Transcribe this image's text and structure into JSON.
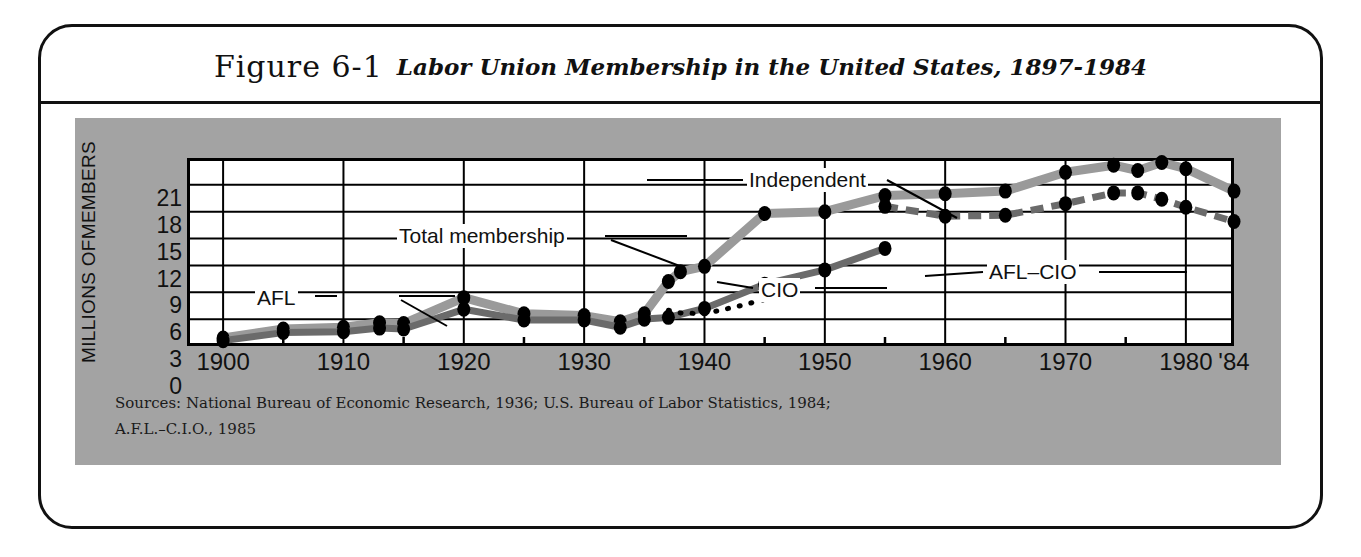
{
  "figure": {
    "number": "Figure 6-1",
    "title": "Labor Union Membership in the United States, 1897-1984"
  },
  "sources": {
    "line1": "Sources:  National Bureau of Economic Research, 1936; U.S. Bureau of Labor Statistics, 1984;",
    "line2": "A.F.L.–C.I.O., 1985"
  },
  "annotations": {
    "afl": "AFL",
    "total": "Total membership",
    "independent": "Independent",
    "cio": "CIO",
    "afl_cio": "AFL–CIO"
  },
  "colors": {
    "plate": "#a3a3a3",
    "total_line": "#9a9a9a",
    "component_line": "#6b6b6b",
    "marker": "#000000",
    "frame": "#111111",
    "plot_bg": "#ffffff"
  },
  "chart_data": {
    "type": "line",
    "title": "Labor Union Membership in the United States, 1897-1984",
    "xlabel": "",
    "ylabel": "MILLIONS OF MEMBERS",
    "xlim": [
      1897,
      1984
    ],
    "ylim": [
      0,
      21
    ],
    "yticks": [
      0,
      3,
      6,
      9,
      12,
      15,
      18,
      21
    ],
    "xticks": [
      1900,
      1910,
      1920,
      1930,
      1940,
      1950,
      1960,
      1970,
      1980,
      1984
    ],
    "xticklabels": [
      "1900",
      "1910",
      "1920",
      "1930",
      "1940",
      "1950",
      "1960",
      "1970",
      "1980",
      "'84"
    ],
    "grid": true,
    "legend": "inline-annotations",
    "units": "millions of members",
    "series": [
      {
        "name": "Total membership",
        "style": "thick-gray-solid",
        "marker": "filled-circle",
        "points": [
          [
            1900,
            0.9
          ],
          [
            1905,
            1.9
          ],
          [
            1910,
            2.1
          ],
          [
            1913,
            2.6
          ],
          [
            1915,
            2.5
          ],
          [
            1920,
            5.4
          ],
          [
            1925,
            3.6
          ],
          [
            1930,
            3.4
          ],
          [
            1933,
            2.7
          ],
          [
            1935,
            3.6
          ],
          [
            1937,
            7.2
          ],
          [
            1938,
            8.3
          ],
          [
            1940,
            8.9
          ],
          [
            1945,
            14.8
          ],
          [
            1950,
            15.0
          ],
          [
            1955,
            16.8
          ],
          [
            1960,
            17.0
          ],
          [
            1965,
            17.3
          ],
          [
            1970,
            19.4
          ],
          [
            1974,
            20.2
          ],
          [
            1976,
            19.6
          ],
          [
            1978,
            20.5
          ],
          [
            1980,
            19.8
          ],
          [
            1984,
            17.3
          ]
        ]
      },
      {
        "name": "AFL",
        "style": "dark-solid",
        "marker": "filled-circle",
        "points": [
          [
            1900,
            0.6
          ],
          [
            1905,
            1.5
          ],
          [
            1910,
            1.6
          ],
          [
            1913,
            2.0
          ],
          [
            1915,
            1.9
          ],
          [
            1920,
            4.1
          ],
          [
            1925,
            2.9
          ],
          [
            1930,
            2.9
          ],
          [
            1933,
            2.1
          ],
          [
            1935,
            3.0
          ],
          [
            1937,
            3.2
          ],
          [
            1940,
            4.2
          ],
          [
            1945,
            6.9
          ],
          [
            1950,
            8.5
          ],
          [
            1955,
            10.9
          ]
        ]
      },
      {
        "name": "CIO",
        "style": "dotted",
        "marker": "small-dot",
        "points": [
          [
            1937,
            4.0
          ],
          [
            1938,
            3.7
          ],
          [
            1940,
            3.6
          ],
          [
            1941,
            3.9
          ],
          [
            1943,
            4.5
          ],
          [
            1945,
            5.2
          ],
          [
            1946,
            5.6
          ]
        ]
      },
      {
        "name": "AFL–CIO",
        "style": "dashed-gray",
        "marker": "filled-circle",
        "points": [
          [
            1955,
            15.6
          ],
          [
            1960,
            14.5
          ],
          [
            1965,
            14.6
          ],
          [
            1970,
            15.9
          ],
          [
            1974,
            17.1
          ],
          [
            1976,
            17.1
          ],
          [
            1978,
            16.4
          ],
          [
            1980,
            15.5
          ],
          [
            1984,
            13.9
          ]
        ]
      },
      {
        "name": "Independent",
        "style": "callout-only",
        "marker": "none",
        "points": []
      }
    ]
  }
}
